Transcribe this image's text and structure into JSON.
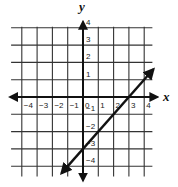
{
  "chart_data": {
    "type": "line",
    "title": "",
    "xlabel": "x",
    "ylabel": "y",
    "xlim": [
      -4.7,
      4.6
    ],
    "ylim": [
      -4.6,
      4.0
    ],
    "grid": true,
    "x_ticks": [
      -4,
      -3,
      -2,
      -1,
      0,
      1,
      2,
      3,
      4
    ],
    "y_ticks": [
      -4,
      -3,
      -2,
      -1,
      1,
      2,
      3,
      4
    ],
    "x_tick_labels": [
      "−4",
      "−3",
      "−2",
      "−1",
      "0",
      "1",
      "2",
      "3",
      "4"
    ],
    "y_tick_labels": [
      "−4",
      "−3",
      "−2",
      "−1",
      "1",
      "2",
      "3",
      "4"
    ],
    "series": [
      {
        "name": "line",
        "equation": "y = x - 3",
        "slope": 1,
        "y_intercept": -3,
        "x_intercept": 3,
        "endpoints": [
          [
            -1.4,
            -4.4
          ],
          [
            4.6,
            1.6
          ]
        ],
        "arrows": "both",
        "color": "#111111"
      }
    ]
  },
  "axes": {
    "x_label": "x",
    "y_label": "y"
  }
}
